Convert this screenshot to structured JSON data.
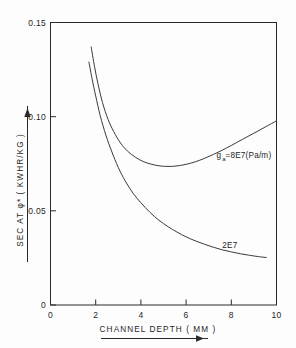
{
  "chart_data": {
    "type": "line",
    "title": "",
    "xlabel": "CHANNEL  DEPTH  ( MM )",
    "ylabel": "SEC  AT  φ*  ( KWHR/KG )",
    "xlim": [
      0,
      10
    ],
    "ylim": [
      0,
      0.15
    ],
    "xticks": [
      "0",
      "2",
      "4",
      "6",
      "8",
      "10"
    ],
    "xtick_values": [
      0,
      2,
      4,
      6,
      8,
      10
    ],
    "yticks": [
      "0",
      "0.05",
      "0.10",
      "0.15"
    ],
    "ytick_values": [
      0,
      0.05,
      0.1,
      0.15
    ],
    "grid": false,
    "legend_position": "inline-annotation",
    "series": [
      {
        "name": "ga_8E7",
        "label": "=8E7(Pa/m)",
        "label_symbol": "g",
        "label_subscript": "a",
        "x": [
          1.8,
          1.95,
          2.1,
          2.3,
          2.55,
          2.8,
          3.1,
          3.4,
          3.75,
          4.1,
          4.45,
          4.8,
          5.1,
          5.4,
          5.7,
          6.0,
          6.4,
          6.8,
          7.2,
          7.6,
          8.0,
          8.5,
          9.0,
          9.5,
          10.0
        ],
        "y": [
          0.137,
          0.1265,
          0.1175,
          0.1075,
          0.0985,
          0.092,
          0.086,
          0.0818,
          0.0785,
          0.0762,
          0.0748,
          0.0739,
          0.0736,
          0.0736,
          0.074,
          0.0747,
          0.076,
          0.0778,
          0.0799,
          0.0822,
          0.0847,
          0.088,
          0.0912,
          0.0945,
          0.0978
        ]
      },
      {
        "name": "ga_2E7",
        "label": "2E7",
        "x": [
          1.7,
          1.85,
          2.0,
          2.2,
          2.45,
          2.7,
          3.0,
          3.3,
          3.65,
          4.0,
          4.4,
          4.8,
          5.2,
          5.6,
          6.0,
          6.4,
          6.8,
          7.2,
          7.6,
          8.0,
          8.4,
          8.8,
          9.2,
          9.55
        ],
        "y": [
          0.129,
          0.1195,
          0.111,
          0.1005,
          0.0902,
          0.0818,
          0.073,
          0.066,
          0.0594,
          0.0543,
          0.0492,
          0.045,
          0.0416,
          0.0387,
          0.0362,
          0.0341,
          0.0323,
          0.0307,
          0.0293,
          0.0282,
          0.0272,
          0.0264,
          0.0257,
          0.0252
        ]
      }
    ],
    "annotations": [
      {
        "name": "upper-curve-annotation",
        "text": "=8E7(Pa/m)",
        "symbol": "g",
        "subscript": "a",
        "x": 7.35,
        "y": 0.078
      },
      {
        "name": "lower-curve-annotation",
        "text": "2E7",
        "x": 7.6,
        "y": 0.0305
      }
    ]
  },
  "colors": {
    "axis": "#2a2a2a",
    "curve": "#3a3a3a",
    "text": "#1f1f1f",
    "background": "#fdfdfd"
  }
}
